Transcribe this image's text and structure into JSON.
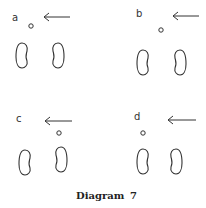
{
  "caption": {
    "word": "Diagram",
    "number": "7"
  },
  "panels": [
    {
      "label": "a",
      "ball_position": "between feet, forward of left foot",
      "arrow_direction": "left"
    },
    {
      "label": "b",
      "ball_position": "between feet, forward",
      "arrow_direction": "left"
    },
    {
      "label": "c",
      "ball_position": "forward of right foot",
      "arrow_direction": "left"
    },
    {
      "label": "d",
      "ball_position": "forward of left foot",
      "arrow_direction": "left"
    }
  ]
}
